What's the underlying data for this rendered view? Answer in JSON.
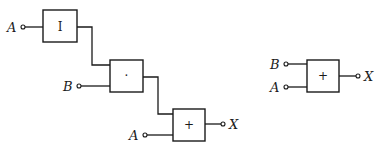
{
  "diagram": {
    "left_circuit": {
      "inputs": [
        {
          "label": "A"
        },
        {
          "label": "B"
        },
        {
          "label": "A"
        }
      ],
      "gates": [
        {
          "symbol": "I",
          "name": "identity"
        },
        {
          "symbol": "·",
          "name": "and"
        },
        {
          "symbol": "+",
          "name": "or"
        }
      ],
      "output": {
        "label": "X"
      }
    },
    "right_circuit": {
      "inputs": [
        {
          "label": "B"
        },
        {
          "label": "A"
        }
      ],
      "gates": [
        {
          "symbol": "+",
          "name": "or"
        }
      ],
      "output": {
        "label": "X"
      }
    },
    "colors": {
      "ink": "#1a1a1a",
      "background": "#ffffff"
    }
  }
}
